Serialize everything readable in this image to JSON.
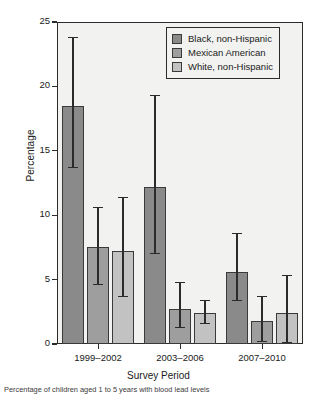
{
  "chart_data": {
    "type": "bar",
    "title": "",
    "xlabel": "Survey Period",
    "ylabel": "Percentage",
    "categories": [
      "1999–2002",
      "2003–2006",
      "2007–2010"
    ],
    "ylim": [
      0,
      25
    ],
    "yticks": [
      0,
      5,
      10,
      15,
      20,
      25
    ],
    "yticklabels": [
      "0",
      "5",
      "10",
      "15",
      "20",
      "25"
    ],
    "grid": false,
    "legend_position": "upper right",
    "errorbars": true,
    "series": [
      {
        "name": "Black, non-Hispanic",
        "color": "#8a8a8a",
        "values": [
          18.5,
          12.2,
          5.6
        ],
        "ci_low": [
          13.7,
          7.0,
          3.4
        ],
        "ci_high": [
          23.8,
          19.3,
          8.6
        ]
      },
      {
        "name": "Mexican American",
        "color": "#9e9e9e",
        "values": [
          7.5,
          2.7,
          1.8
        ],
        "ci_low": [
          4.6,
          1.3,
          0.2
        ],
        "ci_high": [
          10.6,
          4.8,
          3.7
        ]
      },
      {
        "name": "White, non-Hispanic",
        "color": "#c2c2c2",
        "values": [
          7.2,
          2.4,
          2.4
        ],
        "ci_low": [
          3.7,
          1.6,
          0.1
        ],
        "ci_high": [
          11.4,
          3.4,
          5.3
        ]
      }
    ]
  },
  "legend": {
    "items": [
      {
        "label": "Black, non-Hispanic",
        "color": "#8a8a8a"
      },
      {
        "label": "Mexican American",
        "color": "#9e9e9e"
      },
      {
        "label": "White, non-Hispanic",
        "color": "#c2c2c2"
      }
    ]
  },
  "caption": {
    "text": "Percentage of children aged 1 to 5 years with blood lead levels"
  }
}
